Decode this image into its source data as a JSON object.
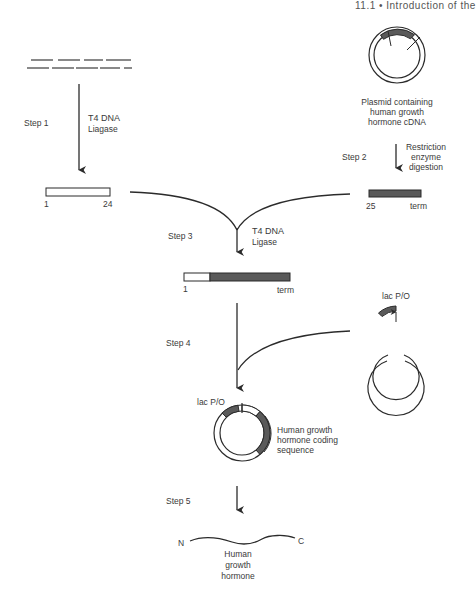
{
  "header": {
    "text": "11.1 • Introduction of the"
  },
  "steps": {
    "step1": {
      "label": "Step 1",
      "enzyme_line1": "T4 DNA",
      "enzyme_line2": "Liagase"
    },
    "step2": {
      "label": "Step 2",
      "action_line1": "Restriction",
      "action_line2": "enzyme",
      "action_line3": "digestion"
    },
    "step3": {
      "label": "Step 3",
      "enzyme_line1": "T4 DNA",
      "enzyme_line2": "Ligase"
    },
    "step4": {
      "label": "Step 4"
    },
    "step5": {
      "label": "Step 5"
    }
  },
  "source_plasmid": {
    "caption_line1": "Plasmid containing",
    "caption_line2": "human growth",
    "caption_line3": "hormone cDNA"
  },
  "fragments": {
    "synthetic": {
      "start": "1",
      "end": "24"
    },
    "restriction": {
      "start": "25",
      "end": "term"
    },
    "ligated": {
      "start": "1",
      "end": "term"
    }
  },
  "vector": {
    "promoter_label": "lac P/O"
  },
  "expression_plasmid": {
    "promoter_label": "lac P/O",
    "insert_line1": "Human growth",
    "insert_line2": "hormone coding",
    "insert_line3": "sequence"
  },
  "product": {
    "n_terminus": "N",
    "c_terminus": "C",
    "name_line1": "Human",
    "name_line2": "growth",
    "name_line3": "hormone"
  },
  "colors": {
    "line": "#2b2b2b",
    "fill_dark": "#5a5a5a",
    "fill_light": "#ffffff"
  }
}
